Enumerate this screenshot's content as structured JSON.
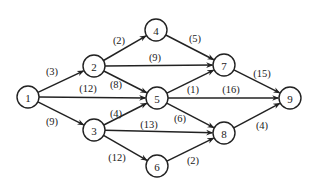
{
  "diagram": {
    "type": "directed-weighted-graph",
    "node_radius": 11,
    "nodes": [
      {
        "id": "1",
        "label": "1",
        "x": 28,
        "y": 97
      },
      {
        "id": "2",
        "label": "2",
        "x": 94,
        "y": 66
      },
      {
        "id": "3",
        "label": "3",
        "x": 94,
        "y": 130
      },
      {
        "id": "4",
        "label": "4",
        "x": 156,
        "y": 30
      },
      {
        "id": "5",
        "label": "5",
        "x": 157,
        "y": 98
      },
      {
        "id": "6",
        "label": "6",
        "x": 157,
        "y": 166
      },
      {
        "id": "7",
        "label": "7",
        "x": 224,
        "y": 65
      },
      {
        "id": "8",
        "label": "8",
        "x": 224,
        "y": 133
      },
      {
        "id": "9",
        "label": "9",
        "x": 290,
        "y": 98
      }
    ],
    "edges": [
      {
        "from": "1",
        "to": "2",
        "weight": "(3)",
        "lx": 52,
        "ly": 71
      },
      {
        "from": "1",
        "to": "5",
        "weight": "(12)",
        "lx": 88,
        "ly": 88
      },
      {
        "from": "1",
        "to": "3",
        "weight": "(9)",
        "lx": 52,
        "ly": 121
      },
      {
        "from": "2",
        "to": "4",
        "weight": "(2)",
        "lx": 119,
        "ly": 40
      },
      {
        "from": "2",
        "to": "7",
        "weight": "(9)",
        "lx": 155,
        "ly": 57
      },
      {
        "from": "2",
        "to": "5",
        "weight": "(8)",
        "lx": 116,
        "ly": 84
      },
      {
        "from": "3",
        "to": "5",
        "weight": "(4)",
        "lx": 116,
        "ly": 113
      },
      {
        "from": "3",
        "to": "8",
        "weight": "(13)",
        "lx": 149,
        "ly": 124
      },
      {
        "from": "3",
        "to": "6",
        "weight": "(12)",
        "lx": 117,
        "ly": 157
      },
      {
        "from": "4",
        "to": "7",
        "weight": "(5)",
        "lx": 195,
        "ly": 38
      },
      {
        "from": "5",
        "to": "7",
        "weight": "(1)",
        "lx": 193,
        "ly": 89
      },
      {
        "from": "5",
        "to": "9",
        "weight": "(16)",
        "lx": 231,
        "ly": 89
      },
      {
        "from": "5",
        "to": "8",
        "weight": "(6)",
        "lx": 180,
        "ly": 118
      },
      {
        "from": "6",
        "to": "8",
        "weight": "(2)",
        "lx": 193,
        "ly": 160
      },
      {
        "from": "7",
        "to": "9",
        "weight": "(15)",
        "lx": 262,
        "ly": 73
      },
      {
        "from": "8",
        "to": "9",
        "weight": "(4)",
        "lx": 262,
        "ly": 125
      }
    ]
  },
  "colors": {
    "stroke": "#222222",
    "background": "#ffffff"
  }
}
